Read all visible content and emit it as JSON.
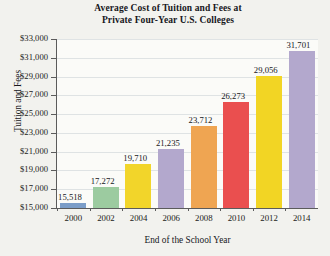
{
  "chart_data": {
    "type": "bar",
    "title": "Average Cost of Tuition and Fees at Private Four-Year U.S. Colleges",
    "title_line1": "Average Cost of Tuition and Fees at",
    "title_line2": "Private Four-Year U.S. Colleges",
    "xlabel": "End of the School Year",
    "ylabel": "Tuition and Fees",
    "categories": [
      "2000",
      "2002",
      "2004",
      "2006",
      "2008",
      "2010",
      "2012",
      "2014"
    ],
    "values": [
      15518,
      17272,
      19710,
      21235,
      23712,
      26273,
      29056,
      31701
    ],
    "value_labels": [
      "15,518",
      "17,272",
      "19,710",
      "21,235",
      "23,712",
      "26,273",
      "29,056",
      "31,701"
    ],
    "bar_colors": [
      "#7b9dc8",
      "#9ccba0",
      "#f2d52a",
      "#b3a8cd",
      "#efa552",
      "#ea4f4f",
      "#f2d524",
      "#b3a8cd"
    ],
    "ylim": [
      15000,
      33000
    ],
    "ytick_labels": [
      "$33,000",
      "$31,000",
      "$29,000",
      "$27,000",
      "$25,000",
      "$23,000",
      "$21,000",
      "$19,000",
      "$17,000",
      "$15,000"
    ],
    "ytick_values": [
      33000,
      31000,
      29000,
      27000,
      25000,
      23000,
      21000,
      19000,
      17000,
      15000
    ],
    "grid": "horizontal",
    "legend": "none"
  }
}
